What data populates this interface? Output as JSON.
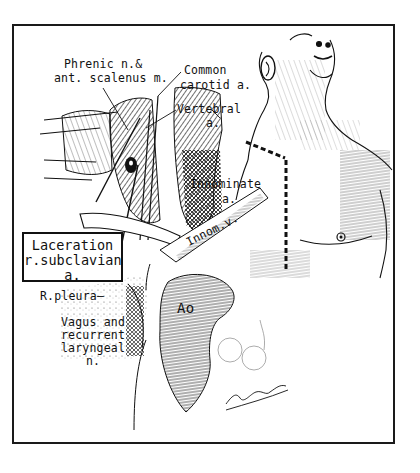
{
  "figure": {
    "type": "anatomical-illustration",
    "labels": {
      "phrenic_line1": "Phrenic n.&",
      "phrenic_line2": "ant. scalenus m.",
      "carotid_line1": "Common",
      "carotid_line2": "carotid a.",
      "vertebral_line1": "Vertebral",
      "vertebral_line2": "a.",
      "innominate_line1": "Innominate",
      "innominate_line2": "a.",
      "innom_v": "Innom.v.",
      "laceration_line1": "Laceration",
      "laceration_line2": "r.subclavian",
      "laceration_line3": "a.",
      "pleura": "R.pleura—",
      "vagus_line1": "Vagus and",
      "vagus_line2": "recurrent",
      "vagus_line3": "laryngeal",
      "vagus_line4": "n.",
      "aorta": "Ao"
    },
    "signature": "artist signature",
    "incision": "dashed line: supraclavicular + median sternotomy"
  }
}
